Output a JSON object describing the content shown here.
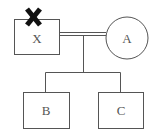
{
  "diagram": {
    "type": "pedigree",
    "nodes": [
      {
        "id": "X",
        "label": "X",
        "shape": "square",
        "deceased": true
      },
      {
        "id": "A",
        "label": "A",
        "shape": "circle"
      },
      {
        "id": "B",
        "label": "B",
        "shape": "square"
      },
      {
        "id": "C",
        "label": "C",
        "shape": "square"
      }
    ],
    "edges": [
      {
        "from": "X",
        "to": "A",
        "type": "consanguineous-marriage"
      },
      {
        "from": "X-A",
        "to": "B",
        "type": "offspring"
      },
      {
        "from": "X-A",
        "to": "C",
        "type": "offspring"
      }
    ],
    "colors": {
      "line": "#555555",
      "cross": "#111111"
    }
  }
}
